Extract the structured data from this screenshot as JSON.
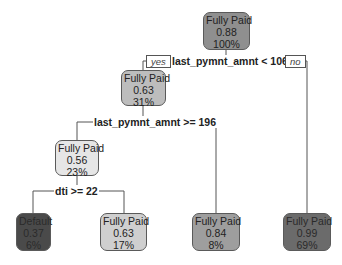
{
  "tree": {
    "branch_labels": {
      "yes": "yes",
      "no": "no"
    },
    "splits": [
      {
        "id": "split-root",
        "label": "last_pymnt_amnt < 1060"
      },
      {
        "id": "split-node2",
        "label": "last_pymnt_amnt >= 196"
      },
      {
        "id": "split-node4",
        "label": "dti >= 22"
      }
    ],
    "nodes": [
      {
        "id": "root",
        "class": "Fully Paid",
        "prob": "0.88",
        "pct": "100%",
        "color": "#8f8f8f"
      },
      {
        "id": "node2",
        "class": "Fully Paid",
        "prob": "0.63",
        "pct": "31%",
        "color": "#bdbdbd"
      },
      {
        "id": "node4",
        "class": "Fully Paid",
        "prob": "0.56",
        "pct": "23%",
        "color": "#e6e6e6"
      },
      {
        "id": "leaf-default",
        "class": "Default",
        "prob": "0.37",
        "pct": "6%",
        "color": "#4a4a4a"
      },
      {
        "id": "leaf-fp-063",
        "class": "Fully Paid",
        "prob": "0.63",
        "pct": "17%",
        "color": "#cfcfcf"
      },
      {
        "id": "leaf-fp-084",
        "class": "Fully Paid",
        "prob": "0.84",
        "pct": "8%",
        "color": "#9e9e9e"
      },
      {
        "id": "leaf-fp-099",
        "class": "Fully Paid",
        "prob": "0.99",
        "pct": "69%",
        "color": "#6b6b6b"
      }
    ]
  }
}
